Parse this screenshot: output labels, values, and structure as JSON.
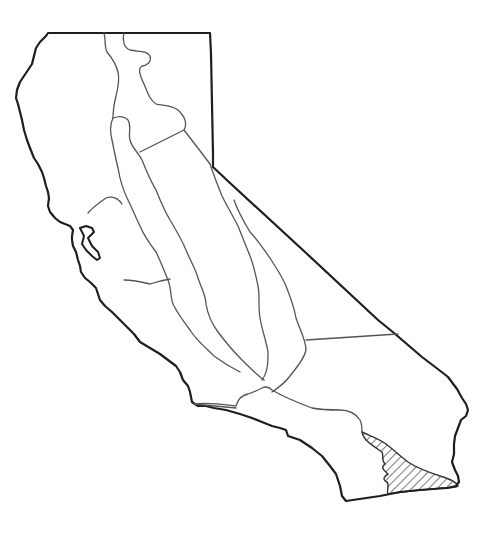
{
  "map": {
    "subject": "California outline map",
    "description": "Outline of California showing internal region (province) boundaries with one highlighted region",
    "highlighted_region": {
      "location": "southeastern California, near the Mexican border",
      "style": "diagonal hatching"
    },
    "colors": {
      "background": "#ffffff",
      "state_outline": "#1e1e1e",
      "region_lines": "#555555",
      "hatch": "#333333"
    },
    "labels": []
  }
}
